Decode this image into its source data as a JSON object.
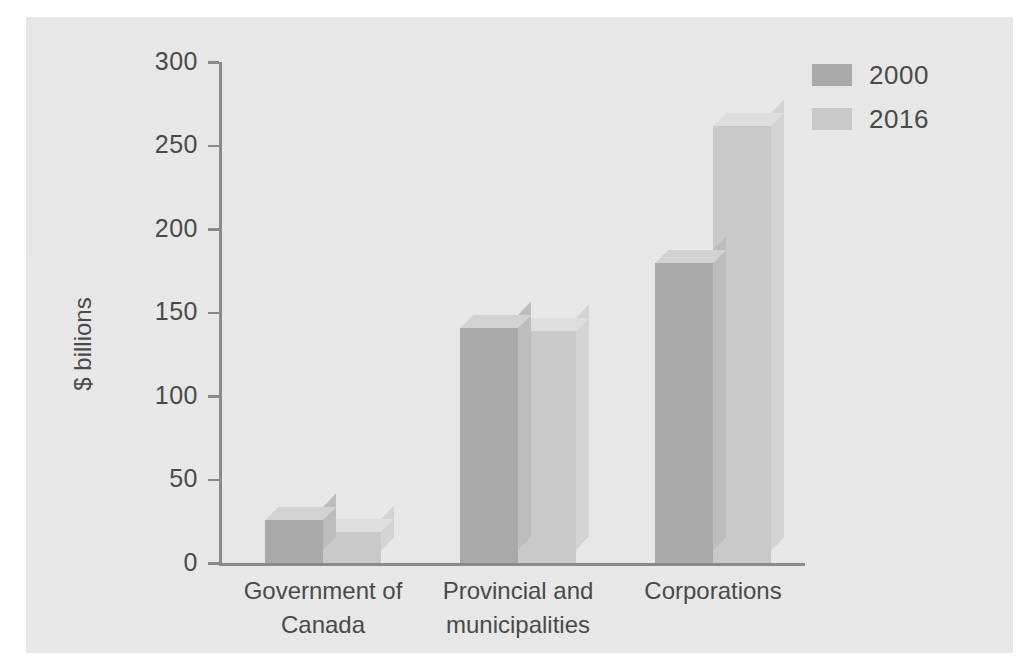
{
  "chart_data": {
    "type": "bar",
    "title": "",
    "subtitle": "",
    "xlabel": "",
    "ylabel": "$ billions",
    "ylim": [
      0,
      300
    ],
    "yticks": [
      0,
      50,
      100,
      150,
      200,
      250,
      300
    ],
    "ytick_labels": [
      "0",
      "50",
      "100",
      "150",
      "200",
      "250",
      "300"
    ],
    "grid": false,
    "legend_position": "top-right",
    "style": "3d-bar",
    "categories": [
      "Government of\nCanada",
      "Provincial and\nmunicipalities",
      "Corporations"
    ],
    "series": [
      {
        "name": "2000",
        "color": "#a9a9a9",
        "values": [
          26,
          141,
          180
        ]
      },
      {
        "name": "2016",
        "color": "#c9c9c9",
        "values": [
          19,
          139,
          262
        ]
      }
    ]
  },
  "colors": {
    "background": "#ffffff",
    "panel": "#e9e9e9",
    "axis": "#8a8a8a",
    "text": "#4a4a4a",
    "series_2000": "#a9a9a9",
    "series_2016": "#c9c9c9"
  }
}
